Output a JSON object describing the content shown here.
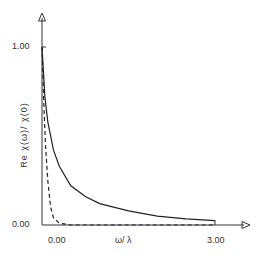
{
  "chart_data": {
    "type": "line",
    "title": "",
    "xlabel": "ω/ λ",
    "ylabel": "Re χ(ω)/ χ(0)",
    "xlim": [
      0,
      3
    ],
    "ylim": [
      0,
      1
    ],
    "x_ticks": [
      "0.00",
      "3.00"
    ],
    "y_ticks": [
      "0.00",
      "1.00"
    ],
    "grid": false,
    "legend": null,
    "series": [
      {
        "name": "solid",
        "style": "solid",
        "x": [
          0.0,
          0.05,
          0.1,
          0.2,
          0.3,
          0.5,
          0.75,
          1.0,
          1.5,
          2.0,
          2.5,
          3.0
        ],
        "y": [
          1.0,
          0.72,
          0.58,
          0.42,
          0.33,
          0.22,
          0.16,
          0.12,
          0.08,
          0.05,
          0.035,
          0.025
        ]
      },
      {
        "name": "dashed",
        "style": "dashed",
        "x": [
          0.0,
          0.03,
          0.06,
          0.1,
          0.15,
          0.2,
          0.3,
          0.5,
          1.0,
          2.0,
          3.0
        ],
        "y": [
          1.0,
          0.7,
          0.45,
          0.25,
          0.1,
          0.04,
          0.01,
          0.0,
          0.0,
          0.0,
          0.0
        ]
      }
    ]
  },
  "labels": {
    "y_top": "1.00",
    "y_bottom": "0.00",
    "x_left": "0.00",
    "x_right": "3.00",
    "xlabel": "ω/ λ",
    "ylabel": "Re χ(ω)/ χ(0)"
  }
}
